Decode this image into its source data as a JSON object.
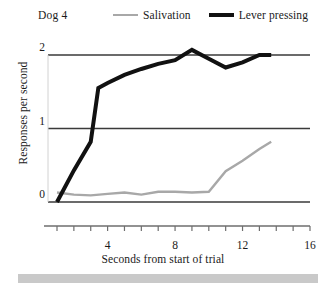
{
  "chart_data": {
    "type": "line",
    "title": "Dog 4",
    "xlabel": "Seconds from start of trial",
    "ylabel": "Responses per second",
    "xlim": [
      0,
      16
    ],
    "ylim": [
      0,
      2.2
    ],
    "xticks": [
      0,
      1,
      2,
      3,
      4,
      5,
      6,
      7,
      8,
      9,
      10,
      11,
      12,
      13,
      14,
      15,
      16
    ],
    "xtick_labels": [
      "4",
      "8",
      "12",
      "16"
    ],
    "xtick_label_values": [
      4,
      8,
      12,
      16
    ],
    "yticks": [
      0,
      1,
      2
    ],
    "ytick_labels": [
      "0",
      "1",
      "2"
    ],
    "grid": "horizontal",
    "legend_position": "top",
    "series": [
      {
        "name": "Salivation",
        "color": "#a8a8a8",
        "width": 2.4,
        "x": [
          1,
          2,
          3,
          4,
          5,
          6,
          7,
          8,
          9,
          10,
          11,
          12,
          13,
          13.7
        ],
        "y": [
          0.13,
          0.1,
          0.09,
          0.11,
          0.13,
          0.1,
          0.14,
          0.14,
          0.13,
          0.14,
          0.42,
          0.56,
          0.72,
          0.82
        ]
      },
      {
        "name": "Lever pressing",
        "color": "#111111",
        "width": 4,
        "x": [
          1,
          2,
          3,
          3.45,
          4,
          5,
          6,
          7,
          8,
          9,
          10,
          11,
          12,
          13,
          13.7
        ],
        "y": [
          0.0,
          0.43,
          0.82,
          1.55,
          1.62,
          1.73,
          1.81,
          1.88,
          1.93,
          2.07,
          1.95,
          1.83,
          1.9,
          2.0,
          2.0
        ]
      }
    ]
  },
  "legend": {
    "items": [
      {
        "label": "Salivation"
      },
      {
        "label": "Lever pressing"
      }
    ]
  },
  "colors": {
    "salivation": "#a8a8a8",
    "lever_pressing": "#111111",
    "gridline": "#3a3a3a",
    "axis": "#6e6e6e",
    "footer_band": "#c9c9c9"
  }
}
